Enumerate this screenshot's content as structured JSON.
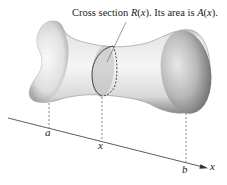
{
  "figure": {
    "caption": {
      "prefix": "Cross section ",
      "section_name": "R",
      "section_arg": "(x)",
      "middle": ". Its area is ",
      "area_name": "A",
      "area_arg": "(x)",
      "suffix": "."
    },
    "axis": {
      "label": "x",
      "ticks": [
        {
          "label": "a"
        },
        {
          "label": "x"
        },
        {
          "label": "b"
        }
      ]
    },
    "colors": {
      "line": "#333333",
      "shape_light": "#f2f2f2",
      "shape_mid": "#c9c9c9",
      "shape_dark": "#7a7a7a",
      "cross_section": "#b5b5b5"
    }
  }
}
